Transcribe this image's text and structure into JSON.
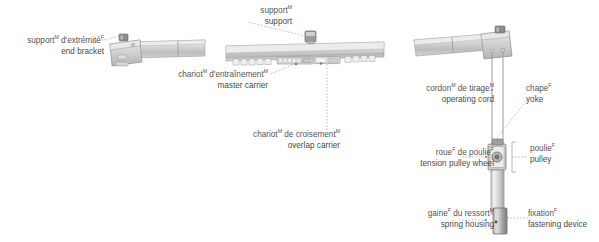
{
  "figure": {
    "background_color": "#ffffff",
    "text_color": "#555555",
    "line_color": "#9a9a9a",
    "metal_light": "#e4e4e4",
    "metal_mid": "#c9c9c9",
    "metal_dark": "#9e9e9e"
  },
  "callouts": [
    {
      "id": "end-bracket",
      "fr": "support",
      "fr_sup": "M",
      "fr2": " d'extrémité",
      "fr2_sup": "F",
      "en": "end bracket",
      "french": "support",
      "english": "end bracket"
    },
    {
      "id": "support",
      "fr": "support",
      "fr_sup": "M",
      "fr2": "",
      "fr2_sup": "",
      "en": "support",
      "french": "support",
      "english": "support"
    },
    {
      "id": "master-carrier",
      "fr": "chariot",
      "fr_sup": "M",
      "fr2": " d'entraînement",
      "fr2_sup": "M",
      "en": "master carrier",
      "french": "chariot d'entraînement",
      "english": "master carrier"
    },
    {
      "id": "overlap-carrier",
      "fr": "chariot",
      "fr_sup": "M",
      "fr2": " de croisement",
      "fr2_sup": "M",
      "en": "overlap carrier",
      "french": "chariot de croisement",
      "english": "overlap carrier"
    },
    {
      "id": "operating-cord",
      "fr": "cordon",
      "fr_sup": "M",
      "fr2": " de tirage",
      "fr2_sup": "M",
      "en": "operating cord",
      "french": "cordon de tirage",
      "english": "operating cord"
    },
    {
      "id": "tension-pulley-wheel",
      "fr": "roue",
      "fr_sup": "F",
      "fr2": " de poulie",
      "fr2_sup": "F",
      "en": "tension pulley wheel",
      "french": "roue de poulie",
      "english": "tension pulley wheel"
    },
    {
      "id": "spring-housing",
      "fr": "gaine",
      "fr_sup": "F",
      "fr2": " du ressort",
      "fr2_sup": "M",
      "en": "spring housing",
      "french": "gaine du ressort",
      "english": "spring housing"
    },
    {
      "id": "yoke",
      "fr": "chape",
      "fr_sup": "F",
      "fr2": "",
      "fr2_sup": "",
      "en": "yoke",
      "french": "chape",
      "english": "yoke"
    },
    {
      "id": "pulley",
      "fr": "poulie",
      "fr_sup": "F",
      "fr2": "",
      "fr2_sup": "",
      "en": "pulley",
      "french": "poulie",
      "english": "pulley"
    },
    {
      "id": "fastening-device",
      "fr": "fixation",
      "fr_sup": "F",
      "fr2": "",
      "fr2_sup": "",
      "en": "fastening device",
      "french": "fixation",
      "english": "fastening device"
    }
  ]
}
